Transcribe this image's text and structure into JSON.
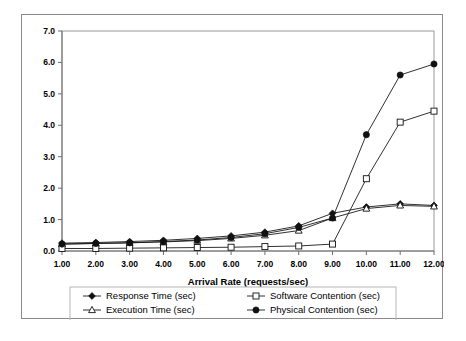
{
  "chart_data": {
    "type": "line",
    "title": "",
    "xlabel": "Arrival Rate (requests/sec)",
    "ylabel": "",
    "grid": false,
    "legend_position": "bottom",
    "xlim": [
      1,
      12
    ],
    "ylim": [
      0,
      7
    ],
    "ytick_step": 1.0,
    "x": [
      1,
      2,
      3,
      4,
      5,
      6,
      7,
      8,
      9,
      10,
      11,
      12
    ],
    "xtick_labels": [
      "1.00",
      "2.00",
      "3.00",
      "4.00",
      "5.00",
      "6.00",
      "7.00",
      "8.00",
      "9.00",
      "10.00",
      "11.00",
      "12.00"
    ],
    "ytick_labels": [
      "0.0",
      "1.0",
      "2.0",
      "3.0",
      "4.0",
      "5.0",
      "6.0",
      "7.0"
    ],
    "series": [
      {
        "name": "Response Time (sec)",
        "marker": "filled-diamond",
        "values": [
          0.25,
          0.27,
          0.3,
          0.34,
          0.4,
          0.48,
          0.6,
          0.8,
          1.2,
          1.4,
          1.5,
          1.45
        ]
      },
      {
        "name": "Execution Time (sec)",
        "marker": "open-triangle",
        "values": [
          0.22,
          0.24,
          0.26,
          0.29,
          0.33,
          0.4,
          0.5,
          0.65,
          1.05,
          1.35,
          1.45,
          1.42
        ]
      },
      {
        "name": "Software Contention (sec)",
        "marker": "open-square",
        "values": [
          0.08,
          0.08,
          0.09,
          0.1,
          0.11,
          0.12,
          0.14,
          0.16,
          0.22,
          2.3,
          4.1,
          4.45
        ]
      },
      {
        "name": "Physical Contention (sec)",
        "marker": "filled-circle",
        "values": [
          0.22,
          0.24,
          0.26,
          0.3,
          0.35,
          0.43,
          0.55,
          0.75,
          1.05,
          3.7,
          5.6,
          5.95
        ]
      }
    ]
  },
  "legend": {
    "entries": [
      {
        "label": "Response Time (sec)",
        "marker": "filled-diamond"
      },
      {
        "label": "Software Contention (sec)",
        "marker": "open-square"
      },
      {
        "label": "Execution Time (sec)",
        "marker": "open-triangle"
      },
      {
        "label": "Physical Contention (sec)",
        "marker": "filled-circle"
      }
    ]
  },
  "colors": {
    "line": "#111111",
    "axis": "#6e6e6e",
    "frame": "#8a8a8a",
    "background": "#ffffff"
  }
}
